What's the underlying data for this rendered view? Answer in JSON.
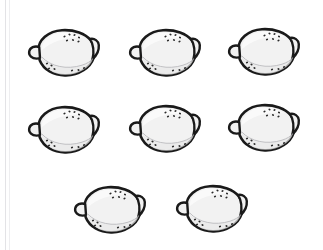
{
  "scene": {
    "title": "Lemons",
    "background_color": "#ffffff",
    "item_name": "lemon",
    "item_count": 8,
    "arrangement": "3 / 3 / 2",
    "rows": [
      {
        "label": "row-1",
        "count": 3
      },
      {
        "label": "row-2",
        "count": 3
      },
      {
        "label": "row-3",
        "count": 2
      }
    ]
  },
  "style": {
    "outline_color": "#1a1a1a",
    "body_fill": "#f2f2f2",
    "highlight_fill": "#fafafa",
    "shade_fill": "#e8e8e8",
    "speckle_color": "#2b2b2b",
    "edge_rule_color": "#e3e3e6"
  },
  "items": [
    {
      "name": "lemon-1",
      "row": 1,
      "column": 1,
      "x": 24,
      "y": 20
    },
    {
      "name": "lemon-2",
      "row": 1,
      "column": 2,
      "x": 125,
      "y": 20
    },
    {
      "name": "lemon-3",
      "row": 1,
      "column": 3,
      "x": 224,
      "y": 19
    },
    {
      "name": "lemon-4",
      "row": 2,
      "column": 1,
      "x": 24,
      "y": 97
    },
    {
      "name": "lemon-5",
      "row": 2,
      "column": 2,
      "x": 125,
      "y": 96
    },
    {
      "name": "lemon-6",
      "row": 2,
      "column": 3,
      "x": 224,
      "y": 95
    },
    {
      "name": "lemon-7",
      "row": 3,
      "column": 1,
      "x": 70,
      "y": 177
    },
    {
      "name": "lemon-8",
      "row": 3,
      "column": 2,
      "x": 172,
      "y": 176
    }
  ]
}
